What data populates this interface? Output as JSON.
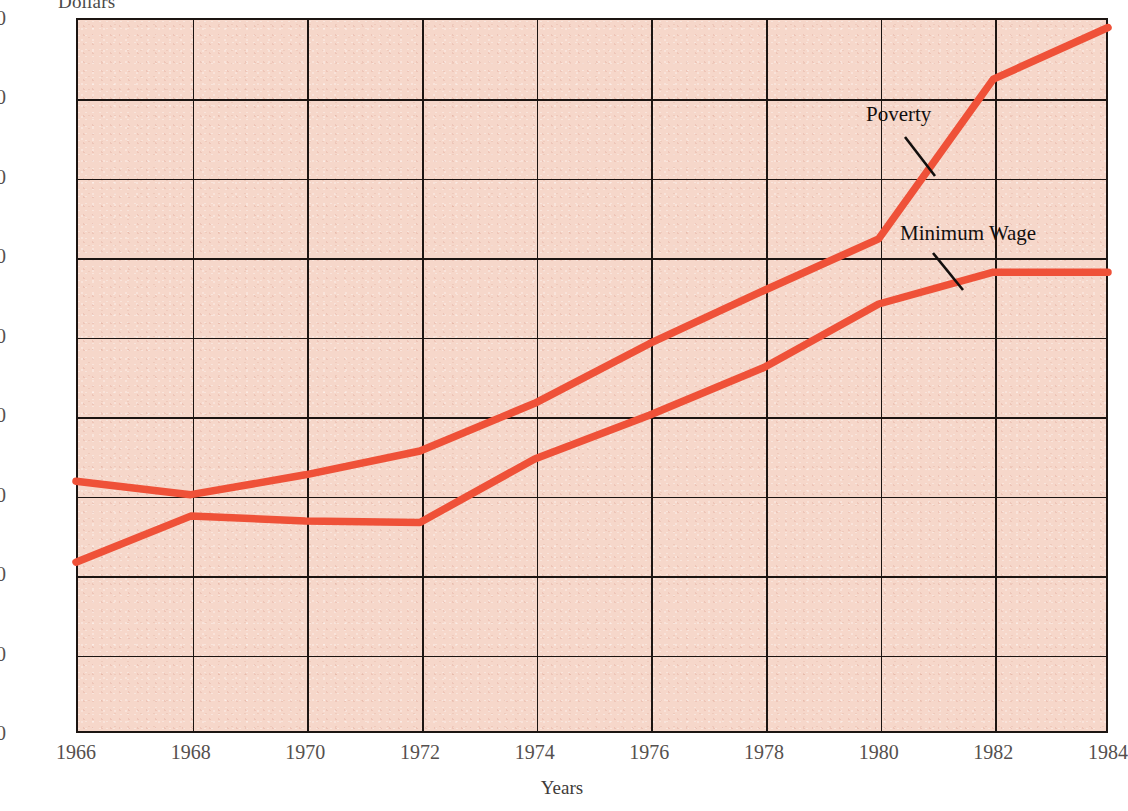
{
  "chart_data": {
    "type": "line",
    "title": "",
    "subtitle": "",
    "xlabel": "Years",
    "ylabel": "Dollars",
    "x": [
      1966,
      1968,
      1970,
      1972,
      1974,
      1976,
      1978,
      1980,
      1982,
      1984
    ],
    "xlim": [
      1966,
      1984
    ],
    "ylim": [
      0,
      900
    ],
    "ytick_labels": [
      "0",
      "100",
      "200",
      "300",
      "400",
      "500",
      "600",
      "700",
      "800",
      "900"
    ],
    "ytick_values": [
      0,
      100,
      200,
      300,
      400,
      500,
      600,
      700,
      800,
      900
    ],
    "xtick_labels": [
      "1966",
      "1968",
      "1970",
      "1972",
      "1974",
      "1976",
      "1978",
      "1980",
      "1982",
      "1984"
    ],
    "grid": true,
    "legend": "inline-annotations",
    "series": [
      {
        "name": "Poverty",
        "color": "#ef5138",
        "values": [
          317,
          300,
          325,
          355,
          415,
          490,
          557,
          622,
          823,
          888
        ]
      },
      {
        "name": "Minimum Wage",
        "color": "#ef5138",
        "values": [
          215,
          273,
          267,
          265,
          345,
          400,
          460,
          540,
          580,
          580
        ]
      }
    ],
    "annotations": [
      {
        "text": "Poverty",
        "series": "Poverty"
      },
      {
        "text": "Minimum Wage",
        "series": "Minimum Wage"
      }
    ],
    "colors": {
      "plot_background": "#f6d7ca",
      "line": "#ef5138",
      "axis": "#1c1512",
      "tick_text": "#55504e",
      "annotation_text": "#120f0e",
      "page_background": "#ffffff"
    }
  },
  "axes": {
    "y_caption": "Dollars",
    "x_title": "Years"
  },
  "annotations": {
    "poverty_label": "Poverty",
    "minimum_wage_label": "Minimum Wage"
  }
}
